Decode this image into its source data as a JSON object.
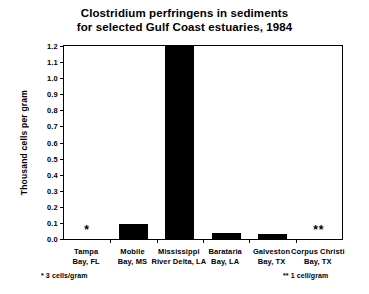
{
  "chart_data": {
    "type": "bar",
    "title": "Clostridium perfringens in sediments for selected Gulf Coast estuaries, 1984",
    "title_lines": [
      "Clostridium perfringens in sediments",
      "for selected Gulf Coast estuaries, 1984"
    ],
    "xlabel": "",
    "ylabel": "Thousand cells per gram",
    "ylim": [
      0.0,
      1.2
    ],
    "ytick_labels": [
      "1.2",
      "1.1",
      "1.0",
      "0.9",
      "0.8",
      "0.7",
      "0.6",
      "0.5",
      "0.4",
      "0.3",
      "0.2",
      "0.1",
      "0.0"
    ],
    "ytick_values": [
      1.2,
      1.1,
      1.0,
      0.9,
      0.8,
      0.7,
      0.6,
      0.5,
      0.4,
      0.3,
      0.2,
      0.1,
      0.0
    ],
    "grid": false,
    "legend": "none",
    "bar_color": "#000000",
    "categories": [
      "Tampa Bay, FL",
      "Mobile Bay, MS",
      "Mississippi River Delta, LA",
      "Barataria Bay, LA",
      "Galveston Bay, TX",
      "Corpus Christi Bay, TX"
    ],
    "category_lines": [
      [
        "Tampa",
        "Bay, FL"
      ],
      [
        "Mobile",
        "Bay, MS"
      ],
      [
        "Mississippi",
        "River Delta, LA"
      ],
      [
        "Barataria",
        "Bay, LA"
      ],
      [
        "Galveston",
        "Bay, TX"
      ],
      [
        "Corpus Christi",
        "Bay, TX"
      ]
    ],
    "values": [
      0.003,
      0.095,
      1.2,
      0.04,
      0.03,
      0.001
    ],
    "value_markers": [
      "*",
      "",
      "",
      "",
      "",
      "**"
    ],
    "annotations": [
      "* 3 cells/gram",
      "** 1 cell/gram"
    ]
  },
  "footnotes": {
    "left": "* 3 cells/gram",
    "right": "** 1 cell/gram"
  }
}
